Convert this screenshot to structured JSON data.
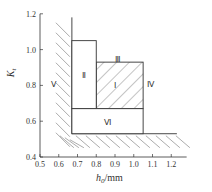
{
  "axes": {
    "x_title_var": "h",
    "x_title_sub": "0",
    "x_title_unit": "/mm",
    "y_title_var": "K",
    "y_title_sub": "t",
    "x_ticks": [
      "0.5",
      "0.6",
      "0.7",
      "0.8",
      "0.9",
      "1.0",
      "1.1",
      "1.2"
    ],
    "y_ticks": [
      "0.4",
      "0.6",
      "0.8",
      "1.0",
      "1.2"
    ],
    "x_range": [
      0.5,
      1.25
    ],
    "y_range": [
      0.4,
      1.22
    ]
  },
  "regions": [
    {
      "id": "I",
      "label": "Ⅰ",
      "x": [
        0.8,
        1.05
      ],
      "y": [
        0.67,
        0.93
      ],
      "hatched": true
    },
    {
      "id": "II",
      "label": "Ⅱ",
      "x": [
        0.67,
        0.8
      ],
      "y": [
        0.67,
        1.05
      ],
      "hatched": false
    },
    {
      "id": "III",
      "label": "Ⅲ",
      "position": "above region I"
    },
    {
      "id": "IV",
      "label": "Ⅳ",
      "position": "right of region I"
    },
    {
      "id": "V",
      "label": "Ⅴ",
      "position": "left of boundary"
    },
    {
      "id": "VI",
      "label": "Ⅵ",
      "x": [
        0.67,
        1.05
      ],
      "y": [
        0.53,
        0.67
      ],
      "hatched": false
    }
  ],
  "boundaries": {
    "left_h": 0.67,
    "bottom_K": 0.53
  }
}
